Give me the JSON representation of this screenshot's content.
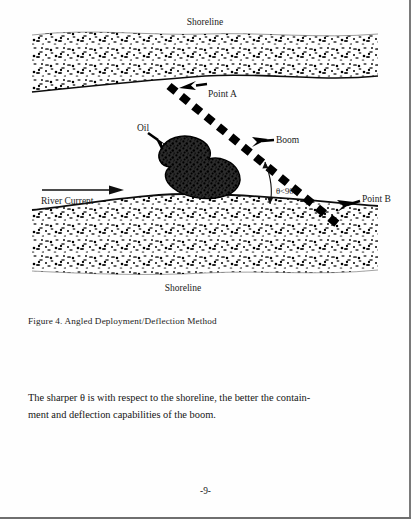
{
  "page": {
    "number_label": "-9-",
    "background_color": "#fefefe",
    "ink_color": "#1a1a1a"
  },
  "figure": {
    "caption": "Figure 4.  Angled Deployment/Deflection Method",
    "labels": {
      "shoreline_top": "Shoreline",
      "shoreline_bottom": "Shoreline",
      "point_a": "Point A",
      "point_b": "Point B",
      "oil": "Oil",
      "boom": "Boom",
      "river_current": "River Current",
      "angle": "θ<90˚"
    },
    "icons": {
      "oil_pointer": "arrow-icon",
      "boom_pointer": "arrow-icon",
      "point_a_pointer": "arrow-icon",
      "point_b_pointer": "arrow-icon",
      "current_direction": "arrow-icon",
      "angle_arc": "arc-icon",
      "boom_line": "dashed-boom-icon",
      "oil_slick": "oil-slick-icon",
      "shoreline_texture_top": "gravel-texture-icon",
      "shoreline_texture_bottom": "gravel-texture-icon"
    },
    "colors": {
      "ink": "#111111",
      "oil_fill": "#262626",
      "texture": "#1d1d1d"
    }
  },
  "body": {
    "line_1": "The sharper θ is with respect to the shoreline, the better the contain-",
    "line_2": "ment and deflection capabilities of the boom."
  }
}
